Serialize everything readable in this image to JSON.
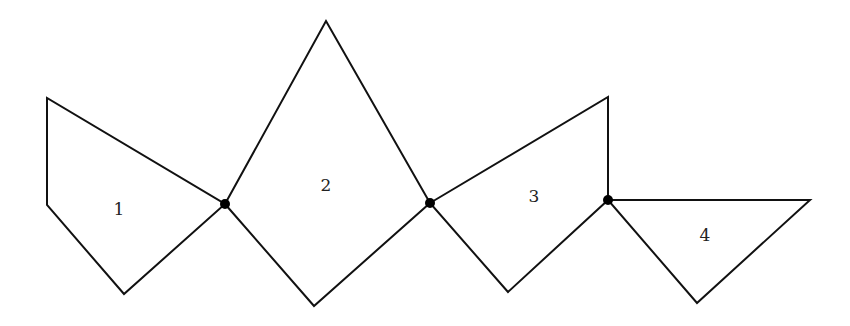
{
  "diagram": {
    "type": "polygon-chain",
    "stroke_color": "#111111",
    "dot_color": "#000000",
    "polygons": [
      {
        "label": "1",
        "points": [
          [
            47,
            98
          ],
          [
            47,
            205
          ],
          [
            124,
            294
          ],
          [
            225,
            204
          ]
        ],
        "label_pos": [
          119,
          210
        ]
      },
      {
        "label": "2",
        "points": [
          [
            225,
            204
          ],
          [
            326,
            21
          ],
          [
            430,
            203
          ],
          [
            314,
            306
          ]
        ],
        "label_pos": [
          326,
          186
        ]
      },
      {
        "label": "3",
        "points": [
          [
            430,
            203
          ],
          [
            608,
            97
          ],
          [
            608,
            200
          ],
          [
            508,
            292
          ]
        ],
        "label_pos": [
          534,
          197
        ]
      },
      {
        "label": "4",
        "points": [
          [
            608,
            200
          ],
          [
            810,
            200
          ],
          [
            697,
            303
          ]
        ],
        "label_pos": [
          705,
          236
        ]
      }
    ],
    "joints": [
      [
        225,
        204
      ],
      [
        430,
        203
      ],
      [
        608,
        200
      ]
    ]
  }
}
